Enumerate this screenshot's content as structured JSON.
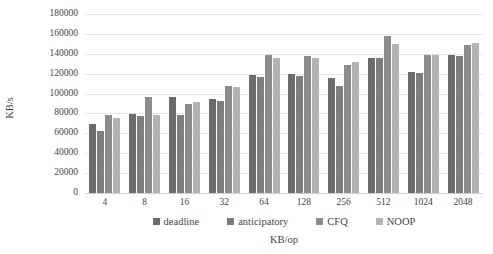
{
  "chart_data": {
    "type": "bar",
    "title": "",
    "subtitle": "",
    "xlabel": "KB/op",
    "ylabel": "KB/s",
    "categories": [
      "4",
      "8",
      "16",
      "32",
      "64",
      "128",
      "256",
      "512",
      "1024",
      "2048"
    ],
    "series": [
      {
        "name": "deadline",
        "color": "#6b6b6b",
        "values": [
          69000,
          79000,
          97000,
          95000,
          118500,
          119500,
          115500,
          136000,
          121500,
          138500
        ]
      },
      {
        "name": "anticipatory",
        "color": "#7d7d7d",
        "values": [
          62000,
          77000,
          78500,
          93000,
          117000,
          118000,
          107500,
          136000,
          120500,
          138000
        ]
      },
      {
        "name": "CFQ",
        "color": "#8c8c8c",
        "values": [
          78500,
          97000,
          89500,
          108000,
          138500,
          138000,
          129000,
          158000,
          139000,
          148500
        ]
      },
      {
        "name": "NOOP",
        "color": "#b3b3b3",
        "values": [
          75000,
          78500,
          91500,
          106500,
          136000,
          135500,
          131500,
          150000,
          138500,
          151000
        ]
      }
    ],
    "ylim": [
      0,
      180000
    ],
    "ytick_values": [
      0,
      20000,
      40000,
      60000,
      80000,
      100000,
      120000,
      140000,
      160000,
      180000
    ],
    "ytick_labels": [
      "0",
      "20000",
      "40000",
      "60000",
      "80000",
      "100000",
      "120000",
      "140000",
      "160000",
      "180000"
    ],
    "grid": "horizontal",
    "legend_position": "bottom",
    "gridline_color": "#e4e4e6",
    "background_color": "#ffffff",
    "text_color": "#3f3f3f"
  }
}
